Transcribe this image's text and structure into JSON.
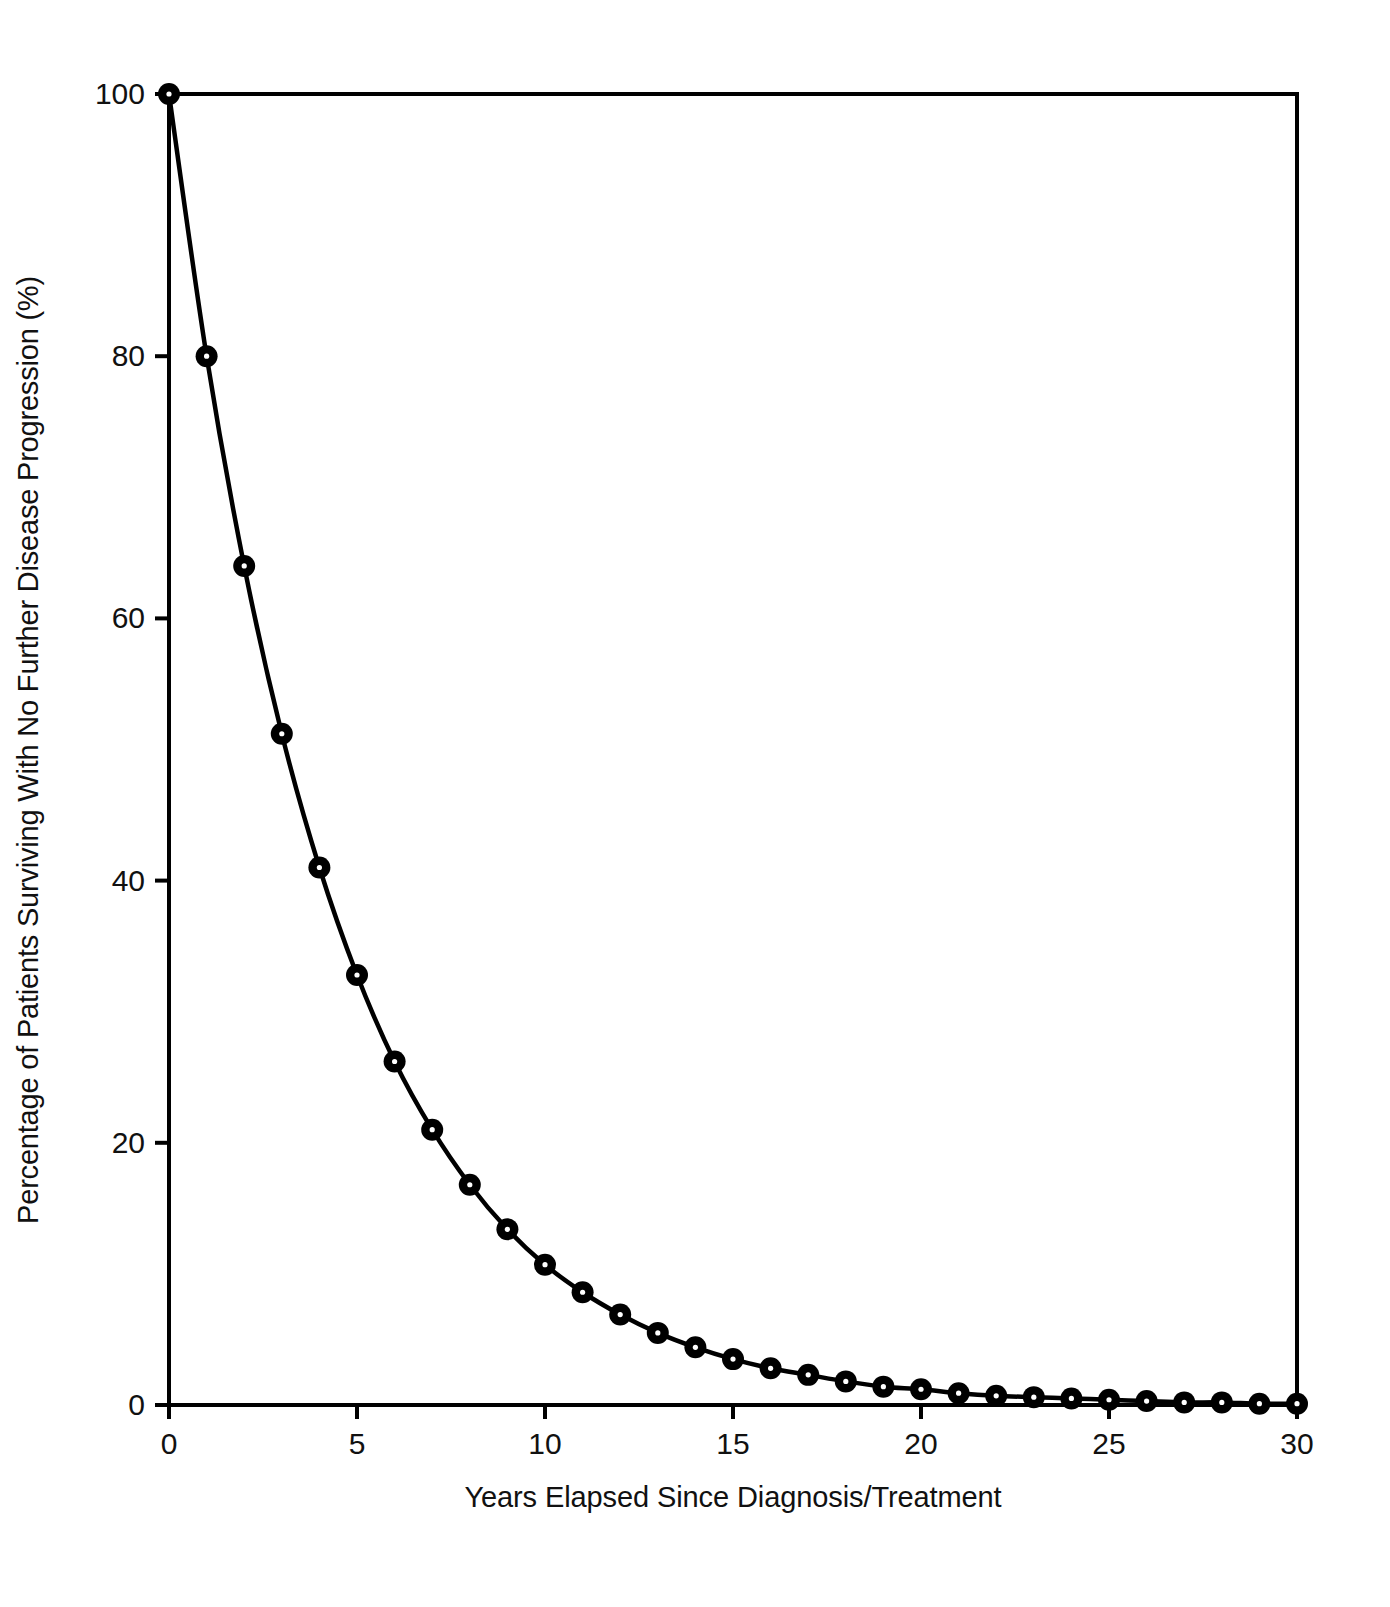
{
  "chart_data": {
    "type": "line",
    "title": "",
    "xlabel": "Years Elapsed Since Diagnosis/Treatment",
    "ylabel": "Percentage of Patients Surviving With No Further Disease Progression (%)",
    "xlim": [
      0,
      30
    ],
    "ylim": [
      0,
      100
    ],
    "xticks": [
      0,
      5,
      10,
      15,
      20,
      25,
      30
    ],
    "xtick_labels": [
      "0",
      "5",
      "10",
      "15",
      "20",
      "25",
      "30"
    ],
    "yticks": [
      0,
      20,
      40,
      60,
      80,
      100
    ],
    "ytick_labels": [
      "0",
      "20",
      "40",
      "60",
      "80",
      "100"
    ],
    "grid": false,
    "legend": null,
    "marker": "filled-circle",
    "line_color": "#000000",
    "marker_color": "#000000",
    "background_color": "#ffffff",
    "frame": "box",
    "x": [
      0,
      1,
      2,
      3,
      4,
      5,
      6,
      7,
      8,
      9,
      10,
      11,
      12,
      13,
      14,
      15,
      16,
      17,
      18,
      19,
      20,
      21,
      22,
      23,
      24,
      25,
      26,
      27,
      28,
      29,
      30
    ],
    "values": [
      100,
      80,
      64,
      51.2,
      41,
      32.8,
      26.2,
      21,
      16.8,
      13.4,
      10.7,
      8.6,
      6.9,
      5.5,
      4.4,
      3.5,
      2.8,
      2.3,
      1.8,
      1.4,
      1.2,
      0.9,
      0.7,
      0.6,
      0.5,
      0.4,
      0.3,
      0.2,
      0.2,
      0.1,
      0.1
    ],
    "series": [
      {
        "name": "Percentage surviving with no further disease progression",
        "values": [
          100,
          80,
          64,
          51.2,
          41,
          32.8,
          26.2,
          21,
          16.8,
          13.4,
          10.7,
          8.6,
          6.9,
          5.5,
          4.4,
          3.5,
          2.8,
          2.3,
          1.8,
          1.4,
          1.2,
          0.9,
          0.7,
          0.6,
          0.5,
          0.4,
          0.3,
          0.2,
          0.2,
          0.1,
          0.1
        ]
      }
    ]
  },
  "axes": {
    "x_title": "Years Elapsed Since Diagnosis/Treatment",
    "y_title": "Percentage of Patients Surviving With No Further Disease Progression (%)"
  }
}
